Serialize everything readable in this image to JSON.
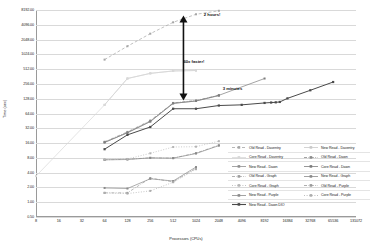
{
  "chart_data": {
    "type": "line",
    "title": "",
    "xlabel": "Processors (CPUs)",
    "ylabel": "Time (sec)",
    "xscale": "log2",
    "yscale": "log2",
    "grid": true,
    "legend_position": "inside-right-bottom",
    "xlim": [
      8,
      131072
    ],
    "ylim": [
      0.5,
      8192
    ],
    "xticks": [
      "8",
      "16",
      "32",
      "64",
      "128",
      "256",
      "512",
      "1024",
      "2048",
      "4096",
      "8192",
      "16384",
      "32768",
      "65536",
      "131072"
    ],
    "yticks": [
      "8192.00",
      "4096.00",
      "2048.00",
      "1024.00",
      "512.00",
      "256.00",
      "128.00",
      "64.00",
      "32.00",
      "16.00",
      "8.00",
      "4.00",
      "2.00",
      "1.00",
      "0.50"
    ],
    "annotations": [
      {
        "text": "2 hours!",
        "x": 1300,
        "y": 6400
      },
      {
        "text": "60x faster!",
        "x": 700,
        "y": 700
      },
      {
        "text": "3 minutes",
        "x": 2300,
        "y": 200
      }
    ],
    "series": [
      {
        "name": "Old Read - Daventry",
        "style": "dashed",
        "color": "#a6a6a6",
        "x": [
          64,
          128,
          256,
          512,
          1024,
          2048
        ],
        "y": [
          800,
          1500,
          2700,
          4600,
          6700,
          7900
        ]
      },
      {
        "name": "New Read - Daventry",
        "style": "solid",
        "color": "#c9c9c9",
        "x": [
          64,
          128,
          256,
          512,
          1024
        ],
        "y": [
          96,
          330,
          420,
          470,
          480
        ]
      },
      {
        "name": "Core Read - Daventry",
        "style": "solid",
        "color": "#d9d9d9",
        "x": [
          8,
          64,
          128,
          256,
          512,
          1024
        ],
        "y": [
          3.4,
          96,
          330,
          420,
          470,
          480
        ]
      },
      {
        "name": "Old Read - Dawn",
        "style": "dash-dot",
        "color": "#8c8c8c",
        "x": [
          64,
          128,
          256,
          512,
          1024,
          2048
        ],
        "y": [
          17,
          27,
          46,
          105,
          118,
          150
        ]
      },
      {
        "name": "New Read - Dawn",
        "style": "solid",
        "color": "#8f8f8f",
        "x": [
          64,
          128,
          256,
          512,
          1024,
          2048
        ],
        "y": [
          16.5,
          26,
          44,
          103,
          115,
          148
        ]
      },
      {
        "name": "Core Read - Dawn",
        "style": "solid",
        "color": "#7d7d7d",
        "x": [
          64,
          128,
          256,
          512,
          1024,
          2048,
          8192
        ],
        "y": [
          16.5,
          26,
          44,
          103,
          115,
          150,
          330
        ]
      },
      {
        "name": "Old Read - Graph",
        "style": "dash-dot",
        "color": "#9e9e9e",
        "x": [
          64,
          128,
          256,
          512,
          1024,
          2048
        ],
        "y": [
          7.3,
          7.5,
          8.0,
          7.9,
          10.0,
          14.5
        ]
      },
      {
        "name": "New Read - Graph",
        "style": "solid",
        "color": "#8a8a8a",
        "x": [
          64,
          128,
          256,
          512,
          1024,
          2048
        ],
        "y": [
          7.3,
          7.4,
          8.0,
          7.9,
          9.8,
          14.2
        ]
      },
      {
        "name": "Core Read - Graph",
        "style": "dotted",
        "color": "#b5b5b5",
        "x": [
          64,
          128,
          256,
          512,
          1024,
          2048
        ],
        "y": [
          7.4,
          7.6,
          9.9,
          13.3,
          13.5,
          17.5
        ]
      },
      {
        "name": "Old Read - Purple",
        "style": "dash-dot",
        "color": "#9a9a9a",
        "x": [
          64,
          128,
          256,
          512,
          1024
        ],
        "y": [
          1.55,
          1.55,
          3.1,
          2.6,
          4.9
        ]
      },
      {
        "name": "New Read - Purple",
        "style": "solid",
        "color": "#8b8b8b",
        "x": [
          64,
          128,
          256,
          512,
          1024
        ],
        "y": [
          1.95,
          1.9,
          3.0,
          2.7,
          5.2
        ]
      },
      {
        "name": "Core Read - Purple",
        "style": "dotted",
        "color": "#adadad",
        "x": [
          64,
          128,
          256,
          512,
          1024
        ],
        "y": [
          1.55,
          1.5,
          1.7,
          2.55,
          4.7
        ]
      },
      {
        "name": "New Read - Dawn DIO",
        "style": "solid-dark",
        "color": "#4a4a4a",
        "x": [
          64,
          128,
          256,
          512,
          1024,
          2048,
          4096,
          8192,
          10000,
          11500,
          13000,
          16384,
          32768,
          65536
        ],
        "y": [
          12.0,
          23.5,
          34.0,
          80.0,
          80.0,
          93.0,
          96.0,
          105.0,
          107.0,
          108.0,
          110.0,
          130.0,
          190.0,
          280.0
        ]
      }
    ]
  },
  "legend": {
    "entries": [
      {
        "label": "Old Read - Daventry"
      },
      {
        "label": "New Read - Daventry"
      },
      {
        "label": "Core Read - Daventry"
      },
      {
        "label": "Old Read - Dawn"
      },
      {
        "label": "New Read - Dawn"
      },
      {
        "label": "Core Read - Dawn"
      },
      {
        "label": "Old Read - Graph"
      },
      {
        "label": "New Read - Graph"
      },
      {
        "label": "Core Read - Graph"
      },
      {
        "label": "Old Read - Purple"
      },
      {
        "label": "New Read - Purple"
      },
      {
        "label": "Core Read - Purple"
      },
      {
        "label": "New Read - Dawn DIO"
      }
    ]
  }
}
